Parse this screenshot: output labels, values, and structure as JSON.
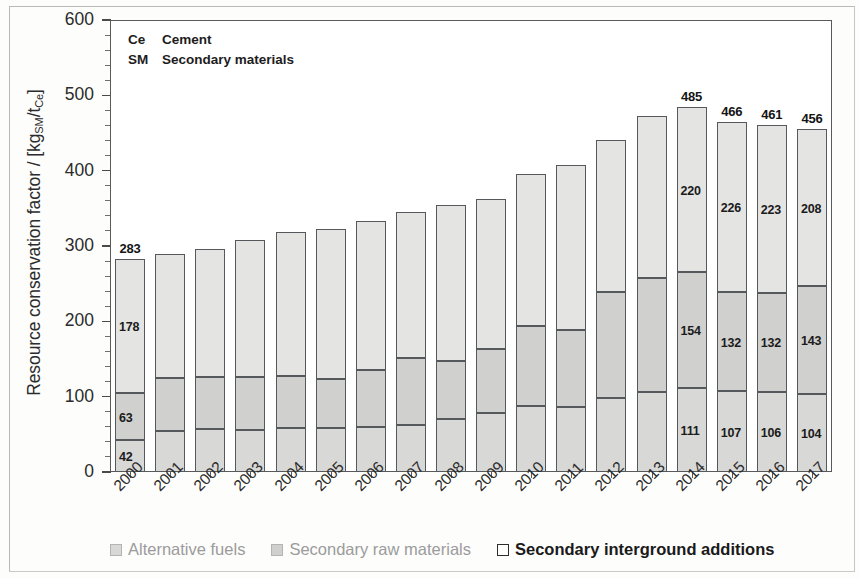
{
  "chart_data": {
    "type": "bar",
    "subtype": "stacked-vertical",
    "title": "",
    "xlabel": "",
    "ylabel": "Resource conservation factor / [kgSM/tCe]",
    "ylim": [
      0,
      600
    ],
    "ytick_labels": [
      "0",
      "100",
      "200",
      "300",
      "400",
      "500",
      "600"
    ],
    "ytick_values": [
      0,
      100,
      200,
      300,
      400,
      500,
      600
    ],
    "minor_tick_step": 20,
    "grid": false,
    "legend_position": "bottom",
    "categories": [
      "2000",
      "2001",
      "2002",
      "2003",
      "2004",
      "2005",
      "2006",
      "2007",
      "2008",
      "2009",
      "2010",
      "2011",
      "2012",
      "2013",
      "2014",
      "2015",
      "2016",
      "2017"
    ],
    "series": [
      {
        "name": "Alternative fuels",
        "values": [
          42,
          55,
          57,
          56,
          58,
          58,
          60,
          62,
          70,
          79,
          87,
          86,
          98,
          106,
          111,
          107,
          106,
          104
        ]
      },
      {
        "name": "Secondary raw materials",
        "values": [
          63,
          70,
          69,
          70,
          70,
          65,
          75,
          89,
          78,
          84,
          107,
          103,
          141,
          152,
          154,
          132,
          132,
          143
        ]
      },
      {
        "name": "Secondary interground additions",
        "values": [
          178,
          164,
          170,
          182,
          190,
          199,
          198,
          194,
          207,
          199,
          201,
          219,
          202,
          214,
          220,
          226,
          223,
          208
        ]
      }
    ],
    "totals": [
      283,
      289,
      296,
      308,
      318,
      322,
      333,
      345,
      355,
      362,
      395,
      408,
      441,
      472,
      485,
      466,
      461,
      456
    ],
    "labeled_bars": {
      "2000": {
        "total": "283",
        "segments": [
          "42",
          "63",
          "178"
        ]
      },
      "2014": {
        "total": "485",
        "segments": [
          "111",
          "154",
          "220"
        ]
      },
      "2015": {
        "total": "466",
        "segments": [
          "107",
          "132",
          "226"
        ]
      },
      "2016": {
        "total": "461",
        "segments": [
          "106",
          "132",
          "223"
        ]
      },
      "2017": {
        "total": "456",
        "segments": [
          "104",
          "143",
          "208"
        ]
      }
    },
    "annotations": [
      {
        "key": "Ce",
        "value": "Cement"
      },
      {
        "key": "SM",
        "value": "Secondary materials"
      }
    ]
  },
  "axis": {
    "y_title_main": "Resource conservation factor / [kg",
    "y_title_sub1": "SM",
    "y_title_mid": "/t",
    "y_title_sub2": "Ce",
    "y_title_end": "]",
    "y_labels": [
      "600",
      "500",
      "400",
      "300",
      "200",
      "100",
      "0"
    ],
    "x_labels": [
      "2000",
      "2001",
      "2002",
      "2003",
      "2004",
      "2005",
      "2006",
      "2007",
      "2008",
      "2009",
      "2010",
      "2011",
      "2012",
      "2013",
      "2014",
      "2015",
      "2016",
      "2017"
    ]
  },
  "note": {
    "rows": [
      {
        "key": "Ce",
        "value": "Cement"
      },
      {
        "key": "SM",
        "value": "Secondary materials"
      }
    ]
  },
  "legend": {
    "items": [
      {
        "label": "Alternative fuels",
        "color": "#d8d8d6",
        "style": "dim"
      },
      {
        "label": "Secondary raw materials",
        "color": "#d0d0ce",
        "style": "dim"
      },
      {
        "label": "Secondary interground additions",
        "color": "#ffffff",
        "style": "strong"
      }
    ]
  },
  "colors": {
    "alternative_fuels": "#d8d8d6",
    "secondary_raw_materials": "#d0d0ce",
    "secondary_interground_additions": "#e4e4e2",
    "axis": "#5a5a5a",
    "text": "#231f20"
  }
}
